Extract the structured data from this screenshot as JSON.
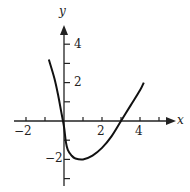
{
  "chart_data": {
    "type": "line",
    "title": "",
    "xlabel": "x",
    "ylabel": "y",
    "xlim": [
      -2.3,
      5.9
    ],
    "ylim": [
      -3.2,
      5.0
    ],
    "x_ticks": [
      -2,
      -1,
      0,
      1,
      2,
      3,
      4,
      5
    ],
    "x_tick_labels": [
      "-2",
      "2",
      "4"
    ],
    "y_ticks": [
      -3,
      -2,
      -1,
      1,
      2,
      3,
      4
    ],
    "y_tick_labels": [
      "-2",
      "2",
      "4"
    ],
    "grid": false,
    "series": [
      {
        "name": "curve",
        "x": [
          -0.8,
          -0.5,
          -0.3,
          -0.15,
          0.0,
          0.1,
          0.2,
          0.4,
          0.6,
          1.0,
          1.5,
          2.0,
          2.5,
          3.0,
          3.5,
          4.0,
          4.2
        ],
        "y": [
          3.2,
          2.2,
          1.3,
          0.5,
          -0.3,
          -1.1,
          -1.5,
          -1.8,
          -1.95,
          -2.0,
          -1.8,
          -1.4,
          -0.8,
          0.0,
          0.8,
          1.6,
          2.0
        ]
      }
    ]
  },
  "labels": {
    "x_axis": "x",
    "y_axis": "y",
    "x_neg2": "−2",
    "x_2": "2",
    "x_4": "4",
    "y_4": "4",
    "y_2": "2",
    "y_neg2": "−2"
  }
}
